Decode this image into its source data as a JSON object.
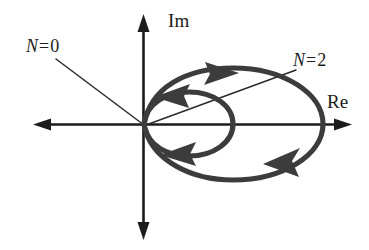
{
  "figure": {
    "kind": "nyquist-plot",
    "background_color": "#ffffff",
    "axis_color": "#1c1c1c",
    "locus_color": "#3c3c3c",
    "leader_color": "#2a2a2a"
  },
  "axes": {
    "imaginary": {
      "label": "Im",
      "name": "imaginary-axis",
      "orientation": "vertical",
      "arrow_ends": "both"
    },
    "real": {
      "label": "Re",
      "name": "real-axis",
      "orientation": "horizontal",
      "arrow_ends": "both"
    },
    "origin": {
      "x": 143,
      "y": 124
    }
  },
  "annotations": [
    {
      "id": "n0",
      "symbol": "N",
      "equals": "=",
      "value": "0",
      "text": "N = 0",
      "points_to": "origin",
      "position": "upper-left"
    },
    {
      "id": "n2",
      "symbol": "N",
      "equals": "=",
      "value": "2",
      "text": "N = 2",
      "points_to": "locus-encirclement",
      "position": "upper-right"
    }
  ],
  "loci": [
    {
      "id": "inner-loop",
      "name": "inner-encirclement-loop",
      "description": "small ellipse from origin",
      "center_x": 188,
      "center_y": 124,
      "radius_x": 45,
      "radius_y": 29,
      "direction": "clockwise",
      "arrow_count": 2
    },
    {
      "id": "outer-loop",
      "name": "outer-encirclement-loop",
      "description": "large ellipse from origin",
      "center_x": 233,
      "center_y": 124,
      "radius_x": 90,
      "radius_y": 53,
      "direction": "clockwise",
      "arrow_count": 2
    }
  ],
  "arrowheads": [
    {
      "id": "outer-top",
      "name": "locus-arrow-outer-top",
      "direction": "right",
      "x": 214,
      "y": 74
    },
    {
      "id": "inner-top",
      "name": "locus-arrow-inner-top",
      "direction": "left",
      "x": 175,
      "y": 90
    },
    {
      "id": "inner-bottom",
      "name": "locus-arrow-inner-bottom",
      "direction": "left",
      "x": 185,
      "y": 151
    },
    {
      "id": "outer-bottom",
      "name": "locus-arrow-outer-bottom",
      "direction": "left",
      "x": 285,
      "y": 163
    }
  ]
}
